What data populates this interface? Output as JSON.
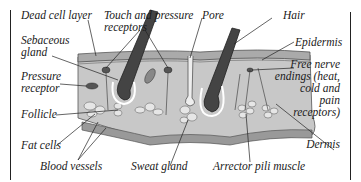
{
  "diagram": {
    "labels": {
      "dead_cell_layer": "Dead cell layer",
      "touch_pressure_1": "Touch and pressure",
      "touch_pressure_2": "receptors",
      "pore": "Pore",
      "hair": "Hair",
      "sebaceous_1": "Sebaceous",
      "sebaceous_2": "gland",
      "epidermis": "Epidermis",
      "pressure_1": "Pressure",
      "pressure_2": "receptor",
      "free_nerve_1": "Free nerve",
      "free_nerve_2": "endings (heat,",
      "free_nerve_3": "cold and",
      "free_nerve_4": "pain",
      "free_nerve_5": "receptors)",
      "follicle": "Follicle",
      "fat_cells": "Fat cells",
      "dermis": "Dermis",
      "blood_vessels": "Blood vessels",
      "sweat_gland": "Sweat gland",
      "arrector": "Arrector pili muscle"
    }
  }
}
